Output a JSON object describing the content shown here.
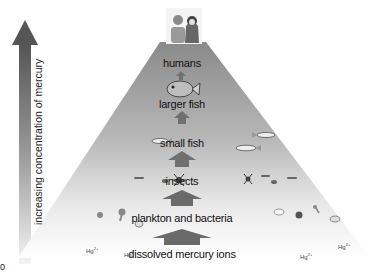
{
  "axis": {
    "label": "increasing concentration of mercury",
    "direction": "up"
  },
  "pyramid": {
    "levels": [
      {
        "label": "humans",
        "icon": "people-icon"
      },
      {
        "label": "larger fish",
        "icon": "large-fish-icon"
      },
      {
        "label": "small fish",
        "icon": "small-fish-icon"
      },
      {
        "label": "insects",
        "icon": "insect-icon"
      },
      {
        "label": "plankton and bacteria",
        "icon": "plankton-icon"
      },
      {
        "label": "dissolved mercury ions",
        "icon": "ion-icon"
      }
    ]
  },
  "ions": [
    {
      "symbol": "Hg",
      "charge": "2+"
    },
    {
      "symbol": "Hg",
      "charge": "2+"
    },
    {
      "symbol": "Hg",
      "charge": "2+"
    },
    {
      "symbol": "Hg",
      "charge": "2+"
    }
  ],
  "corner_text": "0",
  "colors": {
    "pyramid_top": "#8a8a8a",
    "pyramid_bottom": "#ffffff",
    "arrow": "#6e6e6e",
    "axis_arrow_top": "#555555",
    "axis_arrow_bottom": "#f2f2f2"
  }
}
